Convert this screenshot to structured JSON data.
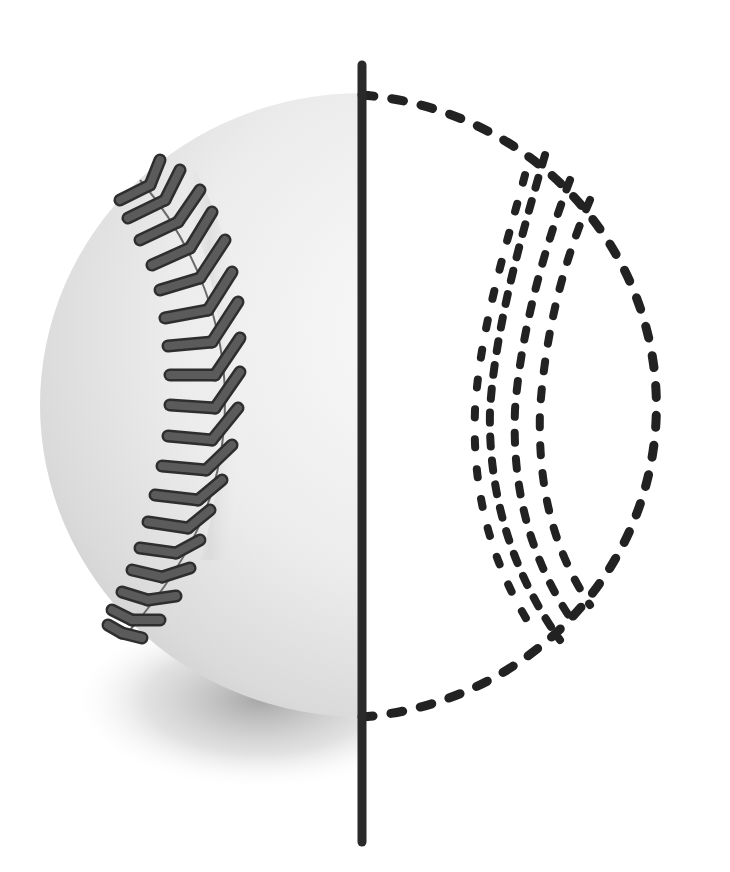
{
  "figure": {
    "subject": "baseball half-rendered, half-outlined",
    "left_half": "shaded baseball hemisphere with herringbone stitching",
    "right_half": "dashed outline with dashed seam stitches",
    "divider": "thick vertical dark line",
    "colors": {
      "background": "#ffffff",
      "ball_light": "#f4f4f4",
      "ball_mid": "#d9d9d9",
      "ball_edge": "#c2c2c2",
      "stitch": "#555555",
      "stitch_outline": "#2e2e2e",
      "seam_line": "#6a6a6a",
      "divider": "#2a2a2a",
      "dash": "#222222",
      "shadow": "#9a9a9a"
    }
  }
}
